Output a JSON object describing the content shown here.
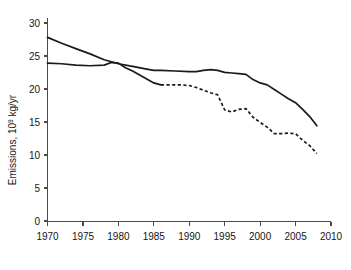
{
  "chart_data": {
    "type": "line",
    "title": "",
    "xlabel": "",
    "ylabel": "Emissions, 10⁹ kg/yr",
    "ylabel_parts": {
      "prefix": "Emissions, 10",
      "exponent": "9",
      "suffix": " kg/yr"
    },
    "xlim": [
      1970,
      2010
    ],
    "ylim": [
      0,
      31
    ],
    "grid": false,
    "legend": "none",
    "xticks": [
      1970,
      1975,
      1980,
      1985,
      1990,
      1995,
      2000,
      2005,
      2010
    ],
    "xtick_labels": [
      "1970",
      "1975",
      "1980",
      "1985",
      "1990",
      "1995",
      "2000",
      "2005",
      "2010"
    ],
    "yticks": [
      0,
      5,
      10,
      15,
      20,
      25,
      30
    ],
    "ytick_labels": [
      "0",
      "5",
      "10",
      "15",
      "20",
      "25",
      "30"
    ],
    "series": [
      {
        "name": "upper-series",
        "style": "solid",
        "color": "#1a1a1a",
        "x": [
          1970,
          1972,
          1974,
          1976,
          1978,
          1980,
          1982,
          1984,
          1985,
          1986,
          1988,
          1990,
          1991,
          1992,
          1993,
          1994,
          1995,
          1996,
          1997,
          1998,
          1999,
          2000,
          2001,
          2002,
          2003,
          2004,
          2005,
          2006,
          2007,
          2008
        ],
        "y": [
          27.9,
          27.0,
          26.2,
          25.4,
          24.5,
          23.9,
          23.5,
          23.1,
          22.9,
          22.9,
          22.8,
          22.7,
          22.7,
          22.9,
          23.0,
          22.9,
          22.6,
          22.5,
          22.4,
          22.3,
          21.5,
          21.0,
          20.7,
          20.0,
          19.3,
          18.6,
          18.0,
          17.0,
          15.9,
          14.5
        ]
      },
      {
        "name": "lower-series-solid-segment",
        "style": "solid",
        "color": "#1a1a1a",
        "x": [
          1970,
          1972,
          1974,
          1976,
          1978,
          1979,
          1980,
          1981,
          1982,
          1983,
          1984,
          1985,
          1986
        ],
        "y": [
          24.0,
          23.9,
          23.7,
          23.6,
          23.7,
          24.1,
          24.0,
          23.3,
          22.8,
          22.2,
          21.6,
          21.0,
          20.7
        ]
      },
      {
        "name": "lower-series-dashed-segment",
        "style": "dashed",
        "color": "#1a1a1a",
        "x": [
          1986,
          1987,
          1988,
          1989,
          1990,
          1991,
          1992,
          1993,
          1994,
          1995,
          1996,
          1997,
          1998,
          1999,
          2000,
          2001,
          2002,
          2003,
          2004,
          2005,
          2006,
          2007,
          2008
        ],
        "y": [
          20.7,
          20.7,
          20.7,
          20.7,
          20.6,
          20.3,
          19.9,
          19.5,
          19.2,
          16.9,
          16.6,
          17.0,
          17.1,
          15.8,
          15.0,
          14.3,
          13.3,
          13.3,
          13.4,
          13.3,
          12.3,
          11.5,
          10.3
        ]
      }
    ],
    "annotations": []
  },
  "axes": {
    "y_axis_name": "y-axis",
    "x_axis_name": "x-axis"
  }
}
